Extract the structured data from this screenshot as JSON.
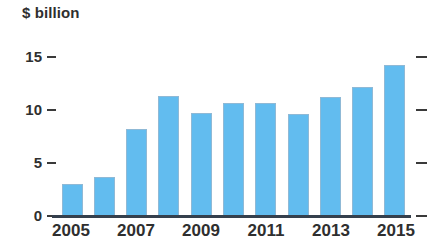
{
  "chart_data": {
    "type": "bar",
    "title": "",
    "subtitle": "",
    "xlabel": "",
    "ylabel": "$ billion",
    "categories": [
      "2005",
      "2006",
      "2007",
      "2008",
      "2009",
      "2010",
      "2011",
      "2012",
      "2013",
      "2014",
      "2015"
    ],
    "values": [
      3.0,
      3.7,
      8.2,
      11.3,
      9.7,
      10.7,
      10.7,
      9.6,
      11.2,
      12.2,
      14.2
    ],
    "x_tick_labels": [
      "2005",
      "2007",
      "2009",
      "2011",
      "2013",
      "2015"
    ],
    "x_tick_categories": [
      "2005",
      "2007",
      "2009",
      "2011",
      "2013",
      "2015"
    ],
    "y_ticks": [
      0,
      5,
      10,
      15
    ],
    "y_tick_labels": [
      "0",
      "5",
      "10",
      "15"
    ],
    "ylim": [
      0,
      15
    ],
    "grid": false,
    "legend": null,
    "legend_position": "none",
    "series": [
      {
        "name": "",
        "values": [
          3.0,
          3.7,
          8.2,
          11.3,
          9.7,
          10.7,
          10.7,
          9.6,
          11.2,
          12.2,
          14.2
        ]
      }
    ],
    "bar_color": "#62bcef",
    "bar_border_color": "#8fb9d6",
    "axis_color": "#35404d",
    "text_color": "#2f2f2f",
    "background_color": "#ffffff",
    "annotations": []
  },
  "axis": {
    "y_title": "$ billion",
    "ticks": {
      "t0": "0",
      "t5": "5",
      "t10": "10",
      "t15": "15"
    },
    "x": {
      "l0": "2005",
      "l1": "2007",
      "l2": "2009",
      "l3": "2011",
      "l4": "2013",
      "l5": "2015"
    }
  }
}
